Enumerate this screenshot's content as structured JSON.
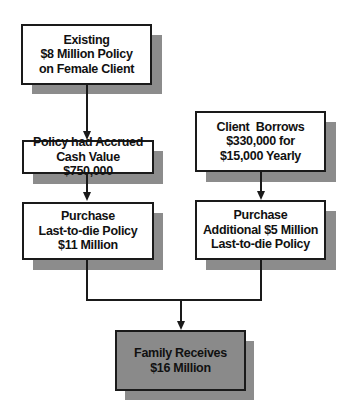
{
  "diagram": {
    "type": "flowchart",
    "nodes": [
      {
        "id": "existing-policy",
        "lines": [
          "Existing",
          "$8 Million Policy",
          "on Female Client"
        ]
      },
      {
        "id": "cash-value",
        "lines": [
          "Policy had Accrued",
          "Cash Value",
          "$750,000"
        ]
      },
      {
        "id": "purchase-11m",
        "lines": [
          "Purchase",
          "Last-to-die Policy",
          "$11 Million"
        ]
      },
      {
        "id": "client-borrows",
        "lines": [
          "Client  Borrows",
          "$330,000 for",
          "$15,000 Yearly"
        ]
      },
      {
        "id": "purchase-5m",
        "lines": [
          "Purchase",
          "Additional $5 Million",
          "Last-to-die Policy"
        ]
      },
      {
        "id": "family-receives",
        "lines": [
          "Family Receives",
          "$16 Million"
        ]
      }
    ],
    "edges": [
      {
        "from": "existing-policy",
        "to": "cash-value"
      },
      {
        "from": "cash-value",
        "to": "purchase-11m"
      },
      {
        "from": "client-borrows",
        "to": "purchase-5m"
      },
      {
        "from": "purchase-11m",
        "to": "family-receives"
      },
      {
        "from": "purchase-5m",
        "to": "family-receives"
      }
    ],
    "colors": {
      "box_fill": "#ffffff",
      "final_box_fill": "#8a8a8a",
      "shadow": "#8c8c8c",
      "stroke": "#1a1a1a"
    }
  }
}
